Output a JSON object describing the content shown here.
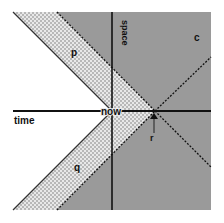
{
  "diagram": {
    "axes": {
      "time_label": "time",
      "space_label": "space"
    },
    "points": {
      "origin_label": "now",
      "event_label": "r"
    },
    "regions": {
      "upper_band_label": "p",
      "lower_band_label": "q",
      "outside_label": "c"
    },
    "colors": {
      "background": "#ffffff",
      "gray_region": "#9a9a9a",
      "hatch_light": "#e6e6e6",
      "hatch_dark": "#b4b4b4",
      "line": "#111111"
    }
  }
}
